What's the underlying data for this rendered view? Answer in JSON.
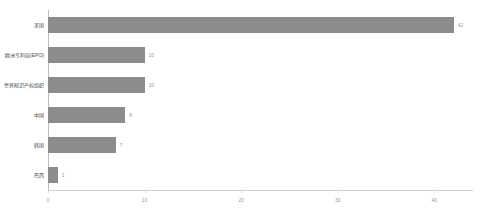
{
  "chart_data": {
    "type": "bar",
    "orientation": "horizontal",
    "title": "",
    "subtitle": "",
    "xlabel": "",
    "ylabel": "",
    "categories": [
      "美国",
      "欧洲专利局(EPO)",
      "世界知识产权组织",
      "中国",
      "韩国",
      "巴西"
    ],
    "values": [
      42,
      10,
      10,
      8,
      7,
      1
    ],
    "value_labels": [
      "42",
      "10",
      "10",
      "8",
      "7",
      "1"
    ],
    "xlim": [
      0,
      44
    ],
    "xticks": [
      0,
      10,
      20,
      30,
      40
    ],
    "xtick_labels": [
      "0",
      "10",
      "20",
      "30",
      "40"
    ],
    "grid": false,
    "legend": null,
    "bar_color": "#8c8c8c",
    "axis_color": "#bdbdbd",
    "label_color": "#4a4a4a",
    "tick_color": "#9a9a9a"
  }
}
